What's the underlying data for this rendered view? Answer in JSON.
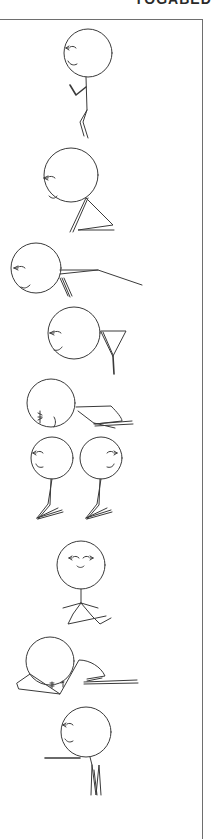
{
  "page": {
    "heading": "YOGABED",
    "heading_note": "partially cropped at top edge"
  },
  "poses": [
    {
      "id": 1,
      "name": "standing-prayer"
    },
    {
      "id": 2,
      "name": "seated-forward-triangle"
    },
    {
      "id": 3,
      "name": "lying-arm-extended"
    },
    {
      "id": 4,
      "name": "legs-up-y-shape"
    },
    {
      "id": 5,
      "name": "child-pose-bent"
    },
    {
      "id": 6,
      "name": "kneeling-pair"
    },
    {
      "id": 7,
      "name": "cross-legged-seated"
    },
    {
      "id": 8,
      "name": "curled-forward-fold"
    },
    {
      "id": 9,
      "name": "standing-arm-forward"
    }
  ],
  "colors": {
    "ink": "#3a3a3a",
    "frame": "#6e6e6e",
    "background": "#ffffff"
  }
}
